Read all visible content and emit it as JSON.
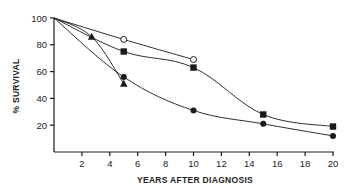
{
  "chart_data": {
    "type": "line",
    "title": "",
    "xlabel": "YEARS AFTER DIAGNOSIS",
    "ylabel": "% SURVIVAL",
    "xlim": [
      0,
      20
    ],
    "ylim": [
      0,
      100
    ],
    "x_ticks": [
      2,
      4,
      6,
      8,
      10,
      12,
      14,
      16,
      18,
      20
    ],
    "y_ticks": [
      20,
      40,
      60,
      80,
      100
    ],
    "grid": false,
    "legend": null,
    "series": [
      {
        "name": "open-circle",
        "marker": "open-circle",
        "x": [
          0,
          5,
          10
        ],
        "y": [
          100,
          84,
          69
        ]
      },
      {
        "name": "filled-square",
        "marker": "filled-square",
        "x": [
          0,
          5,
          10,
          15,
          20
        ],
        "y": [
          100,
          75,
          63,
          28,
          19
        ]
      },
      {
        "name": "filled-circle",
        "marker": "filled-circle",
        "x": [
          0,
          5,
          10,
          15,
          20
        ],
        "y": [
          100,
          56,
          31,
          21,
          12
        ]
      },
      {
        "name": "filled-triangle",
        "marker": "filled-triangle",
        "x": [
          0,
          2.7,
          5
        ],
        "y": [
          100,
          86,
          51
        ]
      }
    ]
  },
  "axes": {
    "xlabel": "YEARS AFTER DIAGNOSIS",
    "ylabel": "% SURVIVAL",
    "x_tick_labels": [
      "2",
      "4",
      "6",
      "8",
      "10",
      "12",
      "14",
      "16",
      "18",
      "20"
    ],
    "y_tick_labels": [
      "100",
      "80",
      "60",
      "40",
      "20"
    ]
  },
  "colors": {
    "ink": "#1a1a1a",
    "background": "#ffffff"
  }
}
